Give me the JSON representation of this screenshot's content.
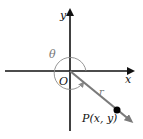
{
  "diagram": {
    "axes": {
      "x_label": "x",
      "y_label": "y",
      "origin_label": "O"
    },
    "angle_label": "θ",
    "radius_label": "r",
    "point_label": "P(x, y)",
    "colors": {
      "axis": "#111111",
      "ray": "#7a7a7a",
      "arc": "#8a8a8a",
      "point": "#000000",
      "angle_label": "#777777",
      "radius_label": "#777777"
    }
  }
}
